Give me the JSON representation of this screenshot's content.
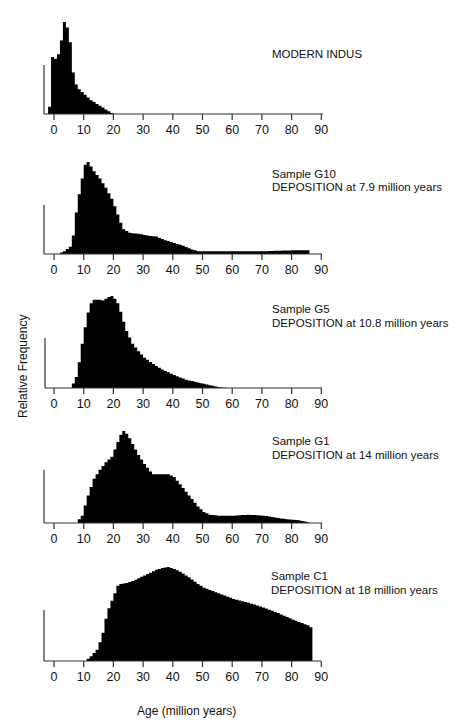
{
  "figure": {
    "ylabel": "Relative Frequency",
    "xlabel": "Age (million years)",
    "ink_color": "#000000",
    "background": "#ffffff"
  },
  "chart_data": [
    {
      "type": "area",
      "title": "MODERN INDUS",
      "subtitle": "",
      "xlabel": "Age (million years)",
      "ylabel": "Relative Frequency",
      "xlim": [
        -3,
        90
      ],
      "xticks": [
        0,
        10,
        20,
        30,
        40,
        50,
        60,
        70,
        80,
        90
      ],
      "grid": false,
      "x": [
        -2,
        -1,
        0,
        1,
        2,
        3,
        4,
        5,
        6,
        7,
        8,
        9,
        10,
        11,
        12,
        13,
        14,
        15,
        16,
        17,
        18,
        19,
        20
      ],
      "values": [
        8,
        62,
        60,
        65,
        80,
        100,
        94,
        78,
        45,
        32,
        27,
        24,
        21,
        18,
        15,
        13,
        11,
        9,
        7,
        5,
        3,
        1,
        0
      ]
    },
    {
      "type": "area",
      "title": "Sample G10",
      "subtitle": "DEPOSITION at 7.9 million years",
      "xlabel": "Age (million years)",
      "ylabel": "Relative Frequency",
      "xlim": [
        -3,
        90
      ],
      "xticks": [
        0,
        10,
        20,
        30,
        40,
        50,
        60,
        70,
        80,
        90
      ],
      "grid": false,
      "x": [
        1,
        3,
        5,
        6,
        7,
        8,
        9,
        10,
        11,
        12,
        13,
        14,
        15,
        16,
        17,
        18,
        19,
        20,
        21,
        22,
        23,
        25,
        28,
        31,
        34,
        37,
        40,
        43,
        46,
        48,
        50,
        60,
        70,
        80,
        86
      ],
      "values": [
        0,
        3,
        8,
        20,
        45,
        65,
        82,
        97,
        100,
        95,
        90,
        86,
        82,
        77,
        72,
        66,
        60,
        52,
        43,
        34,
        27,
        23,
        22,
        20,
        19,
        15,
        12,
        9,
        5,
        3,
        3,
        3,
        3,
        4,
        4
      ]
    },
    {
      "type": "area",
      "title": "Sample G5",
      "subtitle": "DEPOSITION at 10.8 million years",
      "xlabel": "Age (million years)",
      "ylabel": "Relative Frequency",
      "xlim": [
        -3,
        90
      ],
      "xticks": [
        0,
        10,
        20,
        30,
        40,
        50,
        60,
        70,
        80,
        90
      ],
      "grid": false,
      "x": [
        5,
        6,
        7,
        8,
        9,
        10,
        11,
        12,
        13,
        14,
        15,
        16,
        17,
        18,
        19,
        20,
        21,
        22,
        23,
        24,
        25,
        26,
        28,
        30,
        33,
        36,
        40,
        44,
        48,
        52,
        55,
        58
      ],
      "values": [
        0,
        5,
        12,
        28,
        48,
        66,
        82,
        92,
        96,
        96,
        96,
        95,
        97,
        99,
        100,
        97,
        92,
        83,
        72,
        62,
        55,
        48,
        40,
        33,
        26,
        20,
        14,
        9,
        6,
        3,
        1,
        0
      ]
    },
    {
      "type": "area",
      "title": "Sample G1",
      "subtitle": "DEPOSITION at 14 million years",
      "xlabel": "Age (million years)",
      "ylabel": "Relative Frequency",
      "xlim": [
        -3,
        90
      ],
      "xticks": [
        0,
        10,
        20,
        30,
        40,
        50,
        60,
        70,
        80,
        90
      ],
      "grid": false,
      "x": [
        7,
        9,
        11,
        13,
        15,
        17,
        19,
        20,
        21,
        22,
        23,
        24,
        25,
        26,
        27,
        28,
        29,
        30,
        31,
        32,
        33,
        35,
        38,
        40,
        42,
        44,
        46,
        48,
        50,
        52,
        55,
        60,
        65,
        70,
        74,
        78,
        82,
        86
      ],
      "values": [
        0,
        8,
        30,
        48,
        58,
        66,
        72,
        80,
        88,
        96,
        100,
        97,
        92,
        86,
        80,
        74,
        69,
        64,
        60,
        56,
        53,
        53,
        53,
        50,
        42,
        34,
        26,
        18,
        12,
        9,
        8,
        8,
        9,
        8,
        6,
        4,
        3,
        0
      ]
    },
    {
      "type": "area",
      "title": "Sample C1",
      "subtitle": "DEPOSITION at 18 million years",
      "xlabel": "Age (million years)",
      "ylabel": "Relative Frequency",
      "xlim": [
        -3,
        90
      ],
      "xticks": [
        0,
        10,
        20,
        30,
        40,
        50,
        60,
        70,
        80,
        90
      ],
      "grid": false,
      "x": [
        10,
        12,
        14,
        15,
        16,
        17,
        18,
        19,
        20,
        21,
        22,
        24,
        26,
        28,
        30,
        32,
        34,
        36,
        38,
        40,
        42,
        45,
        48,
        50,
        55,
        60,
        65,
        70,
        75,
        80,
        85,
        86,
        87
      ],
      "values": [
        0,
        5,
        12,
        20,
        30,
        45,
        56,
        64,
        72,
        80,
        82,
        83,
        85,
        88,
        91,
        94,
        97,
        99,
        100,
        98,
        95,
        89,
        82,
        78,
        72,
        66,
        62,
        57,
        51,
        44,
        38,
        36,
        0
      ]
    }
  ],
  "panels": [
    {
      "title": "MODERN INDUS",
      "subtitle": ""
    },
    {
      "title": "Sample G10",
      "subtitle": "DEPOSITION at 7.9 million years"
    },
    {
      "title": "Sample G5",
      "subtitle": "DEPOSITION at 10.8 million years"
    },
    {
      "title": "Sample G1",
      "subtitle": "DEPOSITION at 14 million years"
    },
    {
      "title": "Sample C1",
      "subtitle": "DEPOSITION at 18 million years"
    }
  ]
}
